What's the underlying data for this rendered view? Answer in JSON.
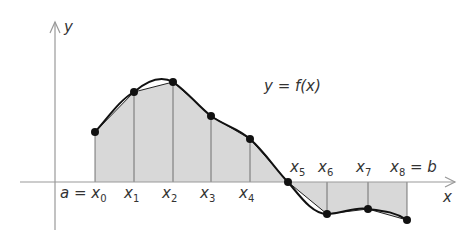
{
  "figure": {
    "curve_label": "y = f(x)",
    "x_axis_label": "x",
    "y_axis_label": "y",
    "colors": {
      "fill": "#d8d8d8",
      "axis": "#999999",
      "curve": "#111111"
    },
    "partition_labels": [
      {
        "text": "a = x",
        "sub": "0"
      },
      {
        "text": "x",
        "sub": "1"
      },
      {
        "text": "x",
        "sub": "2"
      },
      {
        "text": "x",
        "sub": "3"
      },
      {
        "text": "x",
        "sub": "4"
      },
      {
        "text": "x",
        "sub": "5"
      },
      {
        "text": "x",
        "sub": "6"
      },
      {
        "text": "x",
        "sub": "7"
      },
      {
        "text": "x",
        "sub": "8",
        "suffix": " = b"
      }
    ],
    "points": [
      {
        "x": 95,
        "y": 132
      },
      {
        "x": 134,
        "y": 92
      },
      {
        "x": 173,
        "y": 82
      },
      {
        "x": 211,
        "y": 116
      },
      {
        "x": 250,
        "y": 139
      },
      {
        "x": 288,
        "y": 182
      },
      {
        "x": 327,
        "y": 214
      },
      {
        "x": 368,
        "y": 209
      },
      {
        "x": 407,
        "y": 220
      }
    ]
  }
}
